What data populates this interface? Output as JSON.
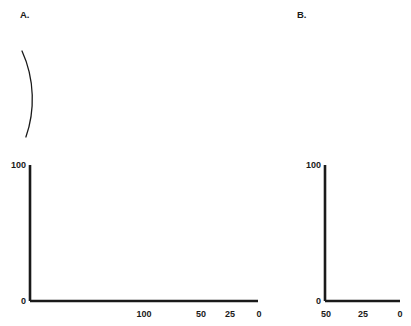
{
  "figure": {
    "background_color": "#ffffff",
    "ink_color": "#1a1a1a",
    "width": 411,
    "height": 326
  },
  "panels": [
    {
      "id": "A",
      "letter": "A.",
      "letter_x": 20,
      "letter_y": 18,
      "arcs": {
        "labels": [
          "100",
          "80",
          "60",
          "40",
          "20",
          "0"
        ],
        "x_positions": [
          22,
          58,
          110,
          156,
          205,
          250
        ],
        "top_y": 51,
        "bottom_y": 137,
        "bow": 13,
        "label_rotation": -58
      },
      "chart_data": {
        "type": "line",
        "title": "",
        "xlabel": "",
        "ylabel": "",
        "x": [
          200,
          0
        ],
        "y": [
          100,
          0
        ],
        "xlim": [
          200,
          0
        ],
        "ylim": [
          0,
          100
        ],
        "x_reversed": true,
        "grid": false,
        "legend": false,
        "xticks": [
          200,
          175,
          150,
          125,
          100,
          75,
          50,
          25,
          0
        ],
        "xticklabels": [
          "",
          "",
          "",
          "",
          "100",
          "",
          "50",
          "25",
          "0"
        ],
        "yticks": [
          0,
          100
        ],
        "yticklabels": [
          "0",
          "100"
        ],
        "series": [
          {
            "name": "decline",
            "points": [
              [
                200,
                100
              ],
              [
                0,
                0
              ]
            ]
          }
        ]
      }
    },
    {
      "id": "B",
      "letter": "B.",
      "letter_x": 297,
      "letter_y": 18,
      "arcs": {
        "labels": [
          "100",
          "80",
          "60",
          "40",
          "20",
          "0"
        ],
        "x_positions": [
          303,
          321,
          339,
          357,
          375,
          391
        ],
        "top_y": 51,
        "bottom_y": 137,
        "bow": 10,
        "label_rotation": -58
      },
      "chart_data": {
        "type": "line",
        "title": "",
        "xlabel": "",
        "ylabel": "",
        "x": [
          50,
          0
        ],
        "y": [
          100,
          0
        ],
        "xlim": [
          50,
          0
        ],
        "ylim": [
          0,
          100
        ],
        "x_reversed": true,
        "grid": false,
        "legend": false,
        "xticks": [
          50,
          25,
          0
        ],
        "xticklabels": [
          "50",
          "25",
          "0"
        ],
        "yticks": [
          0,
          100
        ],
        "yticklabels": [
          "0",
          "100"
        ],
        "series": [
          {
            "name": "decline",
            "points": [
              [
                50,
                100
              ],
              [
                0,
                0
              ]
            ]
          }
        ]
      }
    }
  ],
  "axis_text": {
    "a_y_top": "100",
    "a_y_bottom": "0",
    "a_x_100": "100",
    "a_x_50": "50",
    "a_x_25": "25",
    "a_x_0": "0",
    "b_y_top": "100",
    "b_y_bottom": "0",
    "b_x_50": "50",
    "b_x_25": "25",
    "b_x_0": "0"
  }
}
